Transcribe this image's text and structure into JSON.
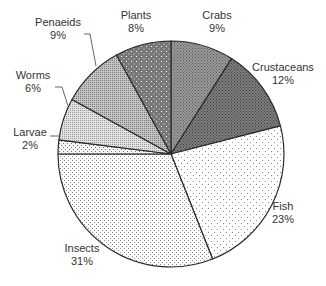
{
  "chart_data": {
    "type": "pie",
    "title": "",
    "start_angle_deg": 0,
    "direction": "clockwise",
    "center": [
      171,
      154
    ],
    "radius": 113,
    "slices": [
      {
        "label": "Crabs",
        "value": 9,
        "pct_label": "9%",
        "fill": "#8a8a8a",
        "pattern": "dense-dots-dark",
        "label_pos": [
          217,
          19
        ],
        "leader": null
      },
      {
        "label": "Crustaceans",
        "value": 12,
        "pct_label": "12%",
        "fill": "#6e6e6e",
        "pattern": "dense-dots-darker",
        "label_pos": [
          283,
          71
        ],
        "leader": null
      },
      {
        "label": "Fish",
        "value": 23,
        "pct_label": "23%",
        "fill": "#f4f4f4",
        "pattern": "sparse-dots-light",
        "label_pos": [
          283,
          210
        ],
        "leader": null
      },
      {
        "label": "Insects",
        "value": 31,
        "pct_label": "31%",
        "fill": "#ebebeb",
        "pattern": "fine-dots-light",
        "label_pos": [
          82,
          252
        ],
        "leader": null
      },
      {
        "label": "Larvae",
        "value": 2,
        "pct_label": "2%",
        "fill": "#f1f1f1",
        "pattern": "sparse-dots",
        "label_pos": [
          30,
          136
        ],
        "leader": [
          [
            50,
            136
          ],
          [
            60,
            136
          ]
        ]
      },
      {
        "label": "Worms",
        "value": 6,
        "pct_label": "6%",
        "fill": "#c8c8c8",
        "pattern": "crosshatch-light",
        "label_pos": [
          33,
          79
        ],
        "leader": [
          [
            55,
            87
          ],
          [
            62,
            87
          ],
          [
            68,
            106
          ]
        ]
      },
      {
        "label": "Penaeids",
        "value": 9,
        "pct_label": "9%",
        "fill": "#a9a9a9",
        "pattern": "crosshatch-medium",
        "label_pos": [
          58,
          26
        ],
        "leader": [
          [
            84,
            34
          ],
          [
            90,
            34
          ],
          [
            96,
            66
          ]
        ]
      },
      {
        "label": "Plants",
        "value": 8,
        "pct_label": "8%",
        "fill": "#7a7a7a",
        "pattern": "dots-on-dark",
        "label_pos": [
          136,
          19
        ],
        "leader": null
      }
    ],
    "legend": "none",
    "colors": {
      "outline": "#2b2b2b",
      "label": "#333333",
      "background": "#ffffff"
    }
  }
}
